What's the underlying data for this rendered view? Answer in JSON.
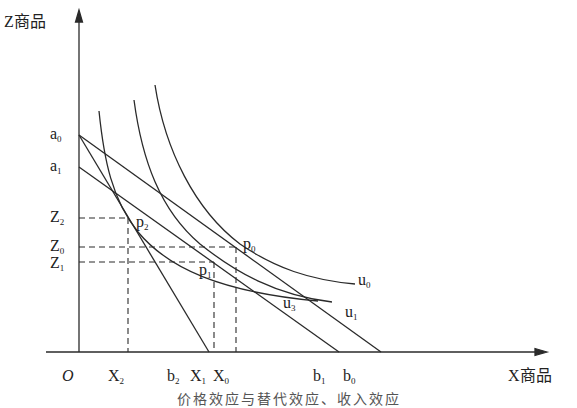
{
  "axes": {
    "y_label": "Z商品",
    "x_label": "X商品",
    "origin": "O"
  },
  "intercepts": {
    "a0": {
      "base": "a",
      "sub": "0"
    },
    "a1": {
      "base": "a",
      "sub": "1"
    },
    "b0": {
      "base": "b",
      "sub": "0"
    },
    "b1": {
      "base": "b",
      "sub": "1"
    },
    "b2": {
      "base": "b",
      "sub": "2"
    }
  },
  "z_ticks": [
    {
      "base": "Z",
      "sub": "2"
    },
    {
      "base": "Z",
      "sub": "0"
    },
    {
      "base": "Z",
      "sub": "1"
    }
  ],
  "x_ticks": [
    {
      "base": "X",
      "sub": "2"
    },
    {
      "base": "X",
      "sub": "1"
    },
    {
      "base": "X",
      "sub": "0"
    }
  ],
  "points": {
    "p0": {
      "base": "p",
      "sub": "0"
    },
    "p1": {
      "base": "p",
      "sub": "1"
    },
    "p2": {
      "base": "p",
      "sub": "2"
    }
  },
  "curves": {
    "u0": {
      "base": "u",
      "sub": "0"
    },
    "u1": {
      "base": "u",
      "sub": "1"
    },
    "u3": {
      "base": "u",
      "sub": "3"
    }
  },
  "caption": "价格效应与替代效应、收入效应",
  "colors": {
    "line": "#2a2a2a",
    "background": "#ffffff"
  }
}
